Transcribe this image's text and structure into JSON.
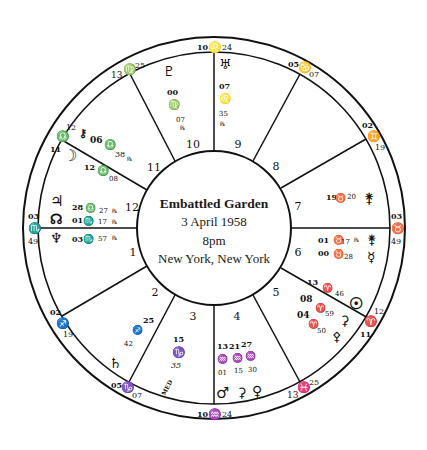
{
  "chart": {
    "title": "Embattled Garden",
    "date": "3 April 1958",
    "time": "8pm",
    "place": "New York, New York",
    "colors": {
      "ink": "#111111",
      "background": "#ffffff"
    }
  },
  "houses": [
    {
      "n": "1",
      "x": 133,
      "y": 256
    },
    {
      "n": "2",
      "x": 155,
      "y": 296
    },
    {
      "n": "3",
      "x": 193,
      "y": 318
    },
    {
      "n": "4",
      "x": 237,
      "y": 318
    },
    {
      "n": "5",
      "x": 276,
      "y": 296
    },
    {
      "n": "6",
      "x": 298,
      "y": 256
    },
    {
      "n": "7",
      "x": 298,
      "y": 210
    },
    {
      "n": "8",
      "x": 276,
      "y": 170
    },
    {
      "n": "9",
      "x": 238,
      "y": 148
    },
    {
      "n": "10",
      "x": 193,
      "y": 148
    },
    {
      "n": "11",
      "x": 154,
      "y": 170
    },
    {
      "n": "12",
      "x": 132,
      "y": 210
    }
  ],
  "cusps": [
    {
      "house": "1",
      "deg": "03",
      "sign": "♏",
      "min": "49",
      "x": 33,
      "y": 228
    },
    {
      "house": "2",
      "deg": "02",
      "sign": "♐",
      "min": "19",
      "x": 57,
      "y": 318
    },
    {
      "house": "3",
      "deg": "05",
      "sign": "♑",
      "min": "07",
      "x": 124,
      "y": 386
    },
    {
      "house": "4",
      "deg": "10",
      "sign": "♒",
      "min": "24",
      "x": 214,
      "y": 413
    },
    {
      "house": "5",
      "deg": "13",
      "sign": "♓",
      "min": "25",
      "x": 300,
      "y": 386
    },
    {
      "house": "6",
      "deg": "11",
      "sign": "♈",
      "min": "12",
      "x": 368,
      "y": 318
    },
    {
      "house": "7",
      "deg": "03",
      "sign": "♉",
      "min": "49",
      "x": 397,
      "y": 228
    },
    {
      "house": "8",
      "deg": "02",
      "sign": "♊",
      "min": "19",
      "x": 372,
      "y": 132
    },
    {
      "house": "9",
      "deg": "05",
      "sign": "♋",
      "min": "07",
      "x": 304,
      "y": 70
    },
    {
      "house": "10",
      "deg": "10",
      "sign": "♌",
      "min": "24",
      "x": 214,
      "y": 44
    },
    {
      "house": "11",
      "deg": "13",
      "sign": "♍",
      "min": "25",
      "x": 128,
      "y": 70
    },
    {
      "house": "12",
      "deg": "11",
      "sign": "♎",
      "min": "12",
      "x": 60,
      "y": 136
    }
  ],
  "planets": [
    {
      "name": "Pluto",
      "glyph": "♇",
      "deg": "00",
      "sign": "♍",
      "min": "07",
      "retro": "℞"
    },
    {
      "name": "Uranus",
      "glyph": "♅",
      "deg": "07",
      "sign": "♌",
      "min": "35",
      "retro": "℞"
    },
    {
      "name": "Chiron",
      "glyph": "⚷",
      "deg": "06",
      "sign": "♎",
      "min": "38",
      "retro": "℞"
    },
    {
      "name": "Moon",
      "glyph": "☽",
      "deg": "12",
      "sign": "♎",
      "min": "08",
      "retro": ""
    },
    {
      "name": "Jupiter",
      "glyph": "♃",
      "deg": "28",
      "sign": "♎",
      "min": "27",
      "retro": "℞"
    },
    {
      "name": "North Node",
      "glyph": "☊",
      "deg": "01",
      "sign": "♏",
      "min": "17",
      "retro": "℞"
    },
    {
      "name": "Neptune",
      "glyph": "♆",
      "deg": "03",
      "sign": "♏",
      "min": "57",
      "retro": "℞"
    },
    {
      "name": "Moon's Apogee (Lilith)",
      "glyph": "⚸",
      "deg": "25",
      "sign": "♐",
      "min": "42",
      "retro": ""
    },
    {
      "name": "Saturn",
      "glyph": "♄",
      "deg": "",
      "sign": "",
      "min": "",
      "retro": ""
    },
    {
      "name": "Midheaven",
      "glyph": "MED",
      "deg": "15",
      "sign": "♑",
      "min": "35",
      "retro": ""
    },
    {
      "name": "Mars",
      "glyph": "♂",
      "deg": "13",
      "sign": "♒",
      "min": "01",
      "retro": ""
    },
    {
      "name": "Ceres",
      "glyph": "⚳",
      "deg": "21",
      "sign": "♒",
      "min": "15",
      "retro": ""
    },
    {
      "name": "Venus",
      "glyph": "♀",
      "deg": "27",
      "sign": "♒",
      "min": "30",
      "retro": ""
    },
    {
      "name": "Sun",
      "glyph": "☉",
      "deg": "13",
      "sign": "♈",
      "min": "46",
      "retro": ""
    },
    {
      "name": "Earth-ceres",
      "glyph": "⚳",
      "deg": "08",
      "sign": "♈",
      "min": "59",
      "retro": ""
    },
    {
      "name": "Pallas",
      "glyph": "⚴",
      "deg": "04",
      "sign": "♈",
      "min": "50",
      "retro": ""
    },
    {
      "name": "Vesta",
      "glyph": "⚵",
      "deg": "19",
      "sign": "♉",
      "min": "20",
      "retro": ""
    },
    {
      "name": "Juno",
      "glyph": "⚵",
      "deg": "01",
      "sign": "♉",
      "min": "17",
      "retro": "℞"
    },
    {
      "name": "Mercury",
      "glyph": "☿",
      "deg": "00",
      "sign": "♉",
      "min": "28",
      "retro": ""
    }
  ]
}
